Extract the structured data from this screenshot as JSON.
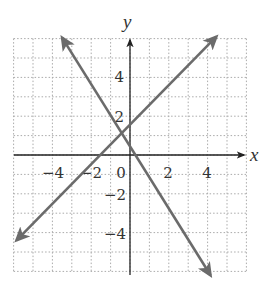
{
  "chart_data": {
    "type": "line",
    "title": "",
    "xlabel": "x",
    "ylabel": "y",
    "xlim": [
      -6,
      6
    ],
    "ylim": [
      -6,
      6
    ],
    "grid": true,
    "grid_style": "dotted",
    "x_tick_labels": [
      "-4",
      "-2",
      "0",
      "2",
      "4"
    ],
    "y_tick_labels": [
      "4",
      "2",
      "-2",
      "-4"
    ],
    "series": [
      {
        "name": "line-increasing",
        "equation_estimate": "y = x + 1.5",
        "x": [
          -5.85,
          4.45
        ],
        "y": [
          -4.4,
          6.1
        ],
        "arrows": "both",
        "color": "#6b6b6b"
      },
      {
        "name": "line-decreasing",
        "equation_estimate": "y = -1.6x + 0.6",
        "x": [
          -3.5,
          4.15
        ],
        "y": [
          6.05,
          -6.2
        ],
        "arrows": "both",
        "color": "#6b6b6b"
      }
    ]
  },
  "labels": {
    "x_axis": "x",
    "y_axis": "y",
    "x_ticks": [
      {
        "text": "−4",
        "x": -4
      },
      {
        "text": "−2",
        "x": -2
      },
      {
        "text": "0",
        "x": 0
      },
      {
        "text": "2",
        "x": 2
      },
      {
        "text": "4",
        "x": 4
      }
    ],
    "y_ticks": [
      {
        "text": "4",
        "y": 4
      },
      {
        "text": "2",
        "y": 2
      },
      {
        "text": "−2",
        "y": -2
      },
      {
        "text": "−4",
        "y": -4
      }
    ]
  },
  "colors": {
    "axis": "#222222",
    "grid": "#aaaaaa",
    "line": "#6b6b6b",
    "text": "#333333"
  }
}
